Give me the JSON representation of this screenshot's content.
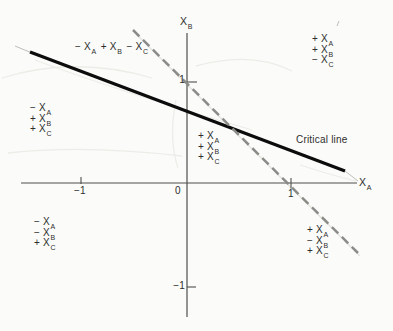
{
  "figure": {
    "background_color": "#fbfbf9",
    "text_color": "#2e2e2c",
    "axis_color": "#4f4f4d",
    "critical_line_color": "#0c0c0c",
    "dashed_line_color": "#8b8b88"
  },
  "axes": {
    "x_label": {
      "var": "X",
      "sub": "A"
    },
    "y_label": {
      "var": "X",
      "sub": "B"
    },
    "x_ticks": [
      {
        "value": "−1"
      },
      {
        "value": "0"
      },
      {
        "value": "1"
      }
    ],
    "y_ticks": [
      {
        "value": "1"
      },
      {
        "value": "−1"
      }
    ]
  },
  "lines": {
    "critical": {
      "label": "Critical line"
    },
    "dashed": {
      "style": "dashed"
    }
  },
  "region_labels": {
    "upper_inline": {
      "terms": [
        {
          "sign": "−",
          "var": "X",
          "sub": "A"
        },
        {
          "sign": "+",
          "var": "X",
          "sub": "B"
        },
        {
          "sign": "−",
          "var": "X",
          "sub": "C"
        }
      ]
    },
    "top_right": {
      "terms": [
        {
          "sign": "+",
          "var": "X",
          "sub": "A"
        },
        {
          "sign": "+",
          "var": "X",
          "sub": "B"
        },
        {
          "sign": "−",
          "var": "X",
          "sub": "C"
        }
      ]
    },
    "left": {
      "terms": [
        {
          "sign": "−",
          "var": "X",
          "sub": "A"
        },
        {
          "sign": "+",
          "var": "X",
          "sub": "B"
        },
        {
          "sign": "+",
          "var": "X",
          "sub": "C"
        }
      ]
    },
    "center": {
      "terms": [
        {
          "sign": "+",
          "var": "X",
          "sub": "A"
        },
        {
          "sign": "+",
          "var": "X",
          "sub": "B"
        },
        {
          "sign": "+",
          "var": "X",
          "sub": "C"
        }
      ]
    },
    "bottom_left": {
      "terms": [
        {
          "sign": "−",
          "var": "X",
          "sub": "A"
        },
        {
          "sign": "−",
          "var": "X",
          "sub": "B"
        },
        {
          "sign": "+",
          "var": "X",
          "sub": "C"
        }
      ]
    },
    "bottom_right": {
      "terms": [
        {
          "sign": "+",
          "var": "X",
          "sub": "A"
        },
        {
          "sign": "−",
          "var": "X",
          "sub": "B"
        },
        {
          "sign": "+",
          "var": "X",
          "sub": "C"
        }
      ]
    }
  },
  "chart_data": {
    "type": "line",
    "title": "",
    "xlabel": "X_A",
    "ylabel": "X_B",
    "xlim": [
      -1.6,
      1.65
    ],
    "ylim": [
      -1.35,
      1.5
    ],
    "x_tick_values": [
      -1,
      0,
      1
    ],
    "y_tick_values": [
      1,
      -1
    ],
    "grid": false,
    "series": [
      {
        "name": "Critical line",
        "style": "solid",
        "points": [
          [
            -1.5,
            1.28
          ],
          [
            1.5,
            0.12
          ]
        ]
      },
      {
        "name": "dashed boundary (X_A + X_B = 1)",
        "style": "dashed",
        "points": [
          [
            -0.51,
            1.5
          ],
          [
            1.62,
            -0.69
          ]
        ]
      }
    ],
    "intersection_approx": [
      0.49,
      0.51
    ],
    "annotations": [
      {
        "text": "− X_A + X_B − X_C",
        "x": -0.69,
        "y": 1.32
      },
      {
        "text": "+ X_A + X_B − X_C",
        "x": 1.31,
        "y": 1.3
      },
      {
        "text": "− X_A + X_B + X_C",
        "x": -1.36,
        "y": 0.62
      },
      {
        "text": "+ X_A + X_B + X_C",
        "x": 0.24,
        "y": 0.32
      },
      {
        "text": "Critical line",
        "x": 1.36,
        "y": 0.41
      },
      {
        "text": "− X_A − X_B + X_C",
        "x": -1.33,
        "y": -0.49
      },
      {
        "text": "+ X_A − X_B + X_C",
        "x": 1.29,
        "y": -0.57
      }
    ]
  }
}
